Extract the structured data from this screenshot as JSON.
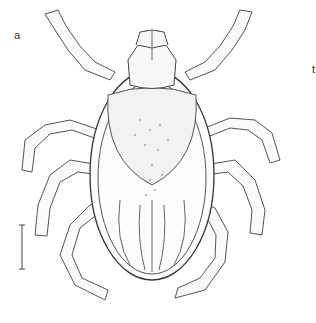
{
  "figure": {
    "panel_labels": [
      "a",
      "t"
    ],
    "scale_bar": true
  }
}
